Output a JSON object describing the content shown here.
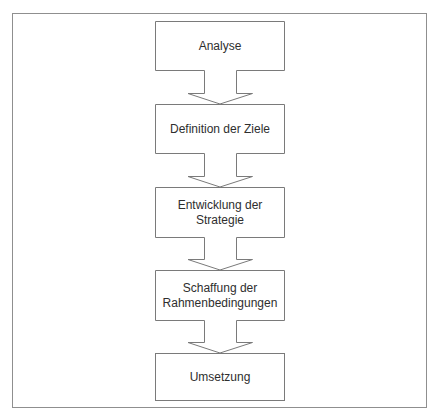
{
  "diagram": {
    "type": "flowchart",
    "direction": "top-to-bottom",
    "colors": {
      "stroke": "#7a7a7a",
      "frame": "#8f8f8f",
      "text": "#2e2e2e",
      "background": "#ffffff"
    },
    "steps": [
      {
        "id": "analyse",
        "label": "Analyse"
      },
      {
        "id": "definition",
        "label": "Definition der Ziele"
      },
      {
        "id": "entwicklung",
        "label": "Entwicklung der Strategie"
      },
      {
        "id": "schaffung",
        "label": "Schaffung der Rahmenbedingungen"
      },
      {
        "id": "umsetzung",
        "label": "Umsetzung"
      }
    ],
    "edges": [
      {
        "from": "analyse",
        "to": "definition"
      },
      {
        "from": "definition",
        "to": "entwicklung"
      },
      {
        "from": "entwicklung",
        "to": "schaffung"
      },
      {
        "from": "schaffung",
        "to": "umsetzung"
      }
    ]
  }
}
